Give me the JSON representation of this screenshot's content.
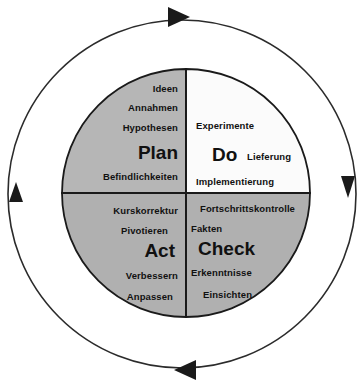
{
  "diagram": {
    "type": "pdca-cycle",
    "rotation": "clockwise",
    "colors": {
      "plan_fill": "#b6b6b6",
      "do_fill": "#fbfbfb",
      "check_fill": "#b0b0b0",
      "act_fill": "#b0b0b0",
      "stroke": "#1a1a1a",
      "text": "#111111",
      "background": "#ffffff"
    },
    "quadrants": [
      {
        "id": "plan",
        "label": "Plan",
        "position": "top-left",
        "items": [
          "Ideen",
          "Annahmen",
          "Hypothesen",
          "Befindlichkeiten"
        ]
      },
      {
        "id": "do",
        "label": "Do",
        "position": "top-right",
        "items": [
          "Experimente",
          "Lieferung",
          "Implementierung"
        ]
      },
      {
        "id": "act",
        "label": "Act",
        "position": "bottom-left",
        "items": [
          "Kurskorrektur",
          "Pivotieren",
          "Verbessern",
          "Anpassen"
        ]
      },
      {
        "id": "check",
        "label": "Check",
        "position": "bottom-right",
        "items": [
          "Fortschrittskontrolle",
          "Fakten",
          "Erkenntnisse",
          "Einsichten"
        ]
      }
    ],
    "arrows": [
      {
        "id": "arrow-top",
        "direction": "right"
      },
      {
        "id": "arrow-right",
        "direction": "down"
      },
      {
        "id": "arrow-bottom",
        "direction": "left"
      },
      {
        "id": "arrow-left",
        "direction": "up"
      }
    ],
    "text": {
      "plan_item_1": "Ideen",
      "plan_item_2": "Annahmen",
      "plan_item_3": "Hypothesen",
      "plan_title": "Plan",
      "plan_item_4": "Befindlichkeiten",
      "do_item_1": "Experimente",
      "do_title": "Do",
      "do_item_2": "Lieferung",
      "do_item_3": "Implementierung",
      "act_item_1": "Kurskorrektur",
      "act_item_2": "Pivotieren",
      "act_title": "Act",
      "act_item_3": "Verbessern",
      "act_item_4": "Anpassen",
      "check_item_1": "Fortschrittskontrolle",
      "check_item_2": "Fakten",
      "check_title": "Check",
      "check_item_3": "Erkenntnisse",
      "check_item_4": "Einsichten"
    }
  }
}
